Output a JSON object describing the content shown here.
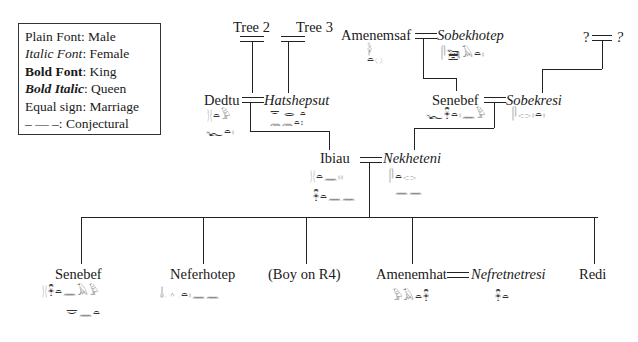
{
  "legend": {
    "rows": [
      {
        "key": "Plain Font",
        "value": ": Male",
        "style": "plain"
      },
      {
        "key": "Italic Font",
        "value": ": Female",
        "style": "italic"
      },
      {
        "key": "Bold Font",
        "value": ": King",
        "style": "bold"
      },
      {
        "key": "Bold Italic",
        "value": ": Queen",
        "style": "bold-italic"
      },
      {
        "key": "Equal sign",
        "value": ": Marriage",
        "style": "plain"
      },
      {
        "key": "–  —  –",
        "value": ": Conjectural",
        "style": "plain"
      }
    ]
  },
  "generation1": {
    "tree2": "Tree 2",
    "tree3": "Tree 3",
    "amenemsaf": "Amenemsaf",
    "sobekhotep": "Sobekhotep",
    "unknown_left": "?",
    "unknown_right": "?"
  },
  "generation2": {
    "dedtu": "Dedtu",
    "hatshepsut": "Hatshepsut",
    "senebef": "Senebef",
    "sobekresi": "Sobekresi"
  },
  "generation3": {
    "ibiau": "Ibiau",
    "nekheteni": "Nekheteni"
  },
  "children": {
    "senebef": "Senebef",
    "neferhotep": "Neferhotep",
    "boy": "(Boy on R4)",
    "amenemhat": "Amenemhat",
    "nefretnetresi": "Nefretnetresi",
    "redi": "Redi"
  },
  "glyphs": {
    "amenemsaf": [
      "𓋀",
      "𓏏𓐍"
    ],
    "sobekhotep": "𓋴𓆋𓄿𓏏𓏤",
    "dedtu_1": "𓊽𓏏𓅱",
    "dedtu_2": "𓆑𓏏𓏤",
    "hatshepsut_1": "𓎟 𓂋 𓏏",
    "hatshepsut_2": "𓈖𓈖𓏏𓏤",
    "senebef_parent": "𓆑𓋹𓏏𓏤𓈖𓅱",
    "sobekresi": "𓋴𓂋𓏤𓏏𓏤",
    "ibiau_1": "𓊽𓏏𓈖𓏤𓏤",
    "ibiau_2": "𓋹𓏏𓈖𓈖",
    "nekheteni_1": "𓋴𓏏𓂋",
    "nekheteni_2": "𓈖𓈖",
    "senebef_child_1": "𓊽𓋹𓏏𓈖𓄿𓅱",
    "senebef_child_2": "𓎟𓈖𓏏",
    "neferhotep": "𓄤𓊵𓏏𓏤𓈖𓈖",
    "amenemhat": "𓅱𓄿𓏏𓋹",
    "nefretnetresi": "𓋹𓏏"
  }
}
